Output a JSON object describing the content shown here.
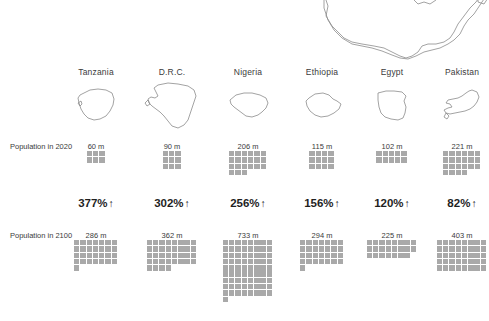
{
  "reference_map": {
    "name": "United States",
    "note": "unlabeled reference outline, clipped at top of frame"
  },
  "row_labels": {
    "population_2020": "Population in 2020",
    "population_2100": "Population in 2100"
  },
  "units": {
    "suffix": "m",
    "per_cell_millions": 10,
    "arrow_up": "↑"
  },
  "colors": {
    "cell": "#a9a9a9",
    "cell_partial": "#bdbdbd",
    "outline": "#8c8c8c",
    "text": "#3b3b3b",
    "growth_text": "#1f1f1f",
    "background": "#ffffff"
  },
  "chart_data": {
    "type": "bar",
    "title": "",
    "subtitle": "",
    "xlabel": "",
    "ylabel": "",
    "categories": [
      "Tanzania",
      "D.R.C.",
      "Nigeria",
      "Ethiopia",
      "Egypt",
      "Pakistan"
    ],
    "series": [
      {
        "name": "Population in 2020",
        "values": [
          60,
          90,
          206,
          115,
          102,
          221
        ]
      },
      {
        "name": "Population in 2100",
        "values": [
          286,
          362,
          733,
          294,
          225,
          403
        ]
      },
      {
        "name": "Growth",
        "values": [
          377,
          302,
          256,
          156,
          120,
          82
        ]
      }
    ],
    "grid": false,
    "legend_position": "none"
  },
  "columns": [
    {
      "country": "Tanzania",
      "pop_2020_label": "60 m",
      "pop_2020_value": 60,
      "pop_2100_label": "286 m",
      "pop_2100_value": 286,
      "growth_label": "377%",
      "growth_arrow": "↑",
      "cells_2020": 6,
      "cells_2020_per_row": 3,
      "cells_2100": 29,
      "cells_2100_per_row": 7
    },
    {
      "country": "D.R.C.",
      "pop_2020_label": "90 m",
      "pop_2020_value": 90,
      "pop_2100_label": "362 m",
      "pop_2100_value": 362,
      "growth_label": "302%",
      "growth_arrow": "↑",
      "cells_2020": 9,
      "cells_2020_per_row": 3,
      "cells_2100": 36,
      "cells_2100_per_row": 8
    },
    {
      "country": "Nigeria",
      "pop_2020_label": "206 m",
      "pop_2020_value": 206,
      "pop_2100_label": "733 m",
      "pop_2100_value": 733,
      "growth_label": "256%",
      "growth_arrow": "↑",
      "cells_2020": 21,
      "cells_2020_per_row": 6,
      "cells_2100": 73,
      "cells_2100_per_row": 8
    },
    {
      "country": "Ethiopia",
      "pop_2020_label": "115 m",
      "pop_2020_value": 115,
      "pop_2100_label": "294 m",
      "pop_2100_value": 294,
      "growth_label": "156%",
      "growth_arrow": "↑",
      "cells_2020": 12,
      "cells_2020_per_row": 4,
      "cells_2100": 29,
      "cells_2100_per_row": 7
    },
    {
      "country": "Egypt",
      "pop_2020_label": "102 m",
      "pop_2020_value": 102,
      "pop_2100_label": "225 m",
      "pop_2100_value": 225,
      "growth_label": "120%",
      "growth_arrow": "↑",
      "cells_2020": 10,
      "cells_2020_per_row": 5,
      "cells_2100": 23,
      "cells_2100_per_row": 8
    },
    {
      "country": "Pakistan",
      "pop_2020_label": "221 m",
      "pop_2020_value": 221,
      "pop_2100_label": "403 m",
      "pop_2100_value": 403,
      "growth_label": "82%",
      "growth_arrow": "↑",
      "cells_2020": 22,
      "cells_2020_per_row": 6,
      "cells_2100": 40,
      "cells_2100_per_row": 8
    }
  ]
}
